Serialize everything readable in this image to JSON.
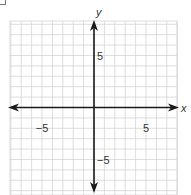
{
  "chart_data": {
    "type": "scatter",
    "title": "",
    "xlabel": "x",
    "ylabel": "y",
    "xlim": [
      -8,
      8
    ],
    "ylim": [
      -8,
      8
    ],
    "grid": true,
    "grid_step": 1,
    "x_tick_labels": [
      {
        "value": -5,
        "label": "−5"
      },
      {
        "value": 5,
        "label": "5"
      }
    ],
    "y_tick_labels": [
      {
        "value": 5,
        "label": "5"
      },
      {
        "value": -5,
        "label": "−5"
      }
    ],
    "series": [],
    "axes_arrows": true,
    "legend": null
  },
  "colors": {
    "grid": "#d4d4d4",
    "axis": "#1a1a1a",
    "text": "#333333",
    "background": "#ffffff"
  }
}
